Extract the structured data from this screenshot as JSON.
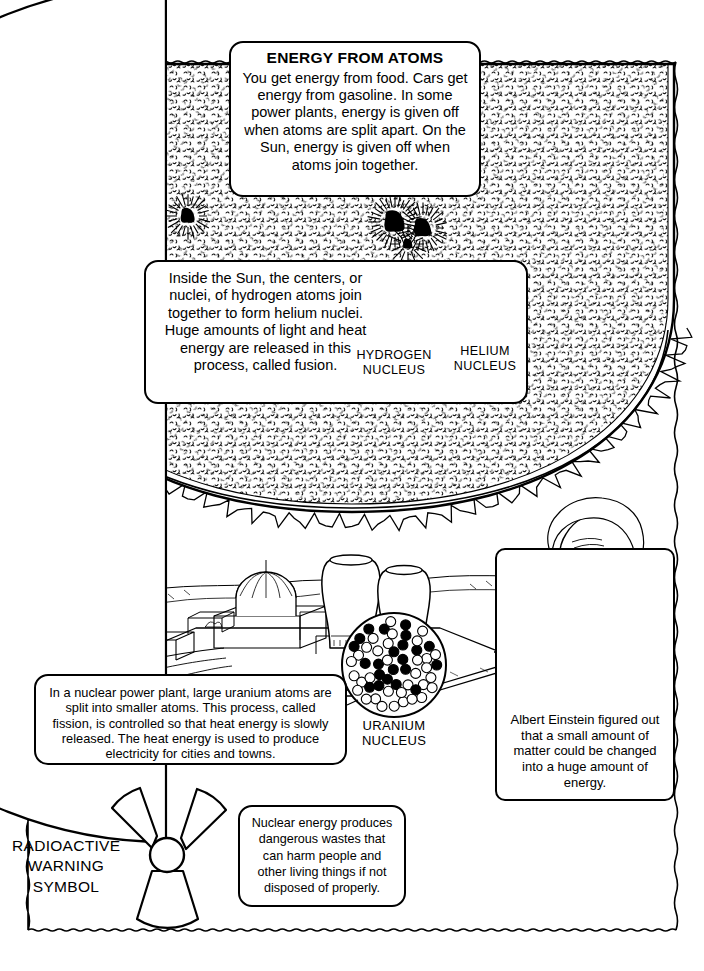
{
  "page": {
    "border_style": "wavy-hand-drawn",
    "ink_color": "#000000",
    "paper_color": "#ffffff"
  },
  "title_box": {
    "heading": "ENERGY FROM ATOMS",
    "body": "You get energy from food. Cars get energy from gasoline. In some power plants, energy is given off when atoms are split apart. On the Sun, energy is given off when atoms join together."
  },
  "fusion_box": {
    "body": "Inside the Sun, the centers, or nuclei, of hydrogen atoms join together to form helium nuclei. Huge amounts of light and heat energy are released in this process, called fusion.",
    "hydrogen_label": "HYDROGEN\nNUCLEUS",
    "helium_label": "HELIUM\nNUCLEUS"
  },
  "fission_box": {
    "body": "In a nuclear power plant, large uranium atoms are split into smaller atoms. This process, called fission, is controlled so that heat energy is slowly released. The heat energy is used to produce electricity for cities and towns."
  },
  "uranium": {
    "label": "URANIUM\nNUCLEUS"
  },
  "einstein_box": {
    "caption": "Albert Einstein figured out that a small amount of matter could be changed into a huge amount of energy."
  },
  "radioactive": {
    "label": "RADIOACTIVE\nWARNING\nSYMBOL"
  },
  "waste_box": {
    "body": "Nuclear energy produces dangerous wastes that can harm people and other living things if not disposed of properly."
  },
  "illustrations": {
    "sun": "sun-with-sunspots-illustration",
    "power_plant": "nuclear-power-plant-illustration",
    "einstein_portrait": "albert-einstein-portrait",
    "hydrogen_nucleus": "hydrogen-nucleus-diagram",
    "helium_nucleus": "helium-nucleus-diagram",
    "uranium_nucleus": "uranium-nucleus-diagram",
    "trefoil": "radioactive-trefoil-symbol"
  }
}
